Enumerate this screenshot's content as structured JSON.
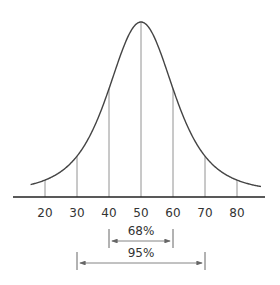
{
  "chart_data": {
    "type": "line",
    "title": "",
    "mean": 50,
    "sd": 10,
    "xlim": [
      13,
      88
    ],
    "ticks": [
      20,
      30,
      40,
      50,
      60,
      70,
      80
    ],
    "tick_labels": [
      "20",
      "30",
      "40",
      "50",
      "60",
      "70",
      "80"
    ],
    "vertical_lines_at": [
      20,
      30,
      40,
      50,
      60,
      70,
      80
    ],
    "intervals": [
      {
        "label": "68%",
        "from": 40,
        "to": 60
      },
      {
        "label": "95%",
        "from": 30,
        "to": 70
      }
    ],
    "xlabel": "",
    "ylabel": "",
    "grid": false
  }
}
